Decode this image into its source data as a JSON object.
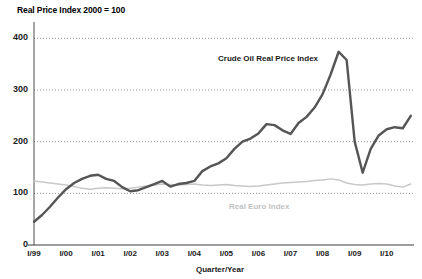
{
  "chart_data": {
    "type": "line",
    "title": "Real Price Index 2000 = 100",
    "xlabel": "Quarter/Year",
    "ylabel": "",
    "ylim": [
      0,
      420
    ],
    "yticks": [
      0,
      100,
      200,
      300,
      400
    ],
    "grid": true,
    "legend_position": "inline-annotation",
    "x_categories": [
      "I/99",
      "I/00",
      "I/01",
      "I/02",
      "I/03",
      "I/04",
      "I/05",
      "I/06",
      "I/07",
      "I/08",
      "I/09",
      "I/10"
    ],
    "series": [
      {
        "name": "Crude Oil Real Price Index",
        "color": "#555555",
        "x": [
          1999.0,
          1999.25,
          1999.5,
          1999.75,
          2000.0,
          2000.25,
          2000.5,
          2000.75,
          2001.0,
          2001.25,
          2001.5,
          2001.75,
          2002.0,
          2002.25,
          2002.5,
          2002.75,
          2003.0,
          2003.25,
          2003.5,
          2003.75,
          2004.0,
          2004.25,
          2004.5,
          2004.75,
          2005.0,
          2005.25,
          2005.5,
          2005.75,
          2006.0,
          2006.25,
          2006.5,
          2006.75,
          2007.0,
          2007.25,
          2007.5,
          2007.75,
          2008.0,
          2008.25,
          2008.5,
          2008.75,
          2009.0,
          2009.25,
          2009.5,
          2009.75,
          2010.0,
          2010.25,
          2010.5,
          2010.75
        ],
        "values": [
          45,
          58,
          74,
          92,
          108,
          120,
          128,
          134,
          136,
          128,
          124,
          112,
          104,
          106,
          112,
          118,
          124,
          113,
          118,
          120,
          124,
          143,
          152,
          158,
          168,
          186,
          200,
          206,
          216,
          234,
          232,
          222,
          215,
          236,
          248,
          266,
          292,
          330,
          374,
          358,
          200,
          140,
          186,
          212,
          224,
          228,
          226,
          250
        ]
      },
      {
        "name": "Real Euro Index",
        "color": "#c8c8c8",
        "x": [
          1999.0,
          1999.25,
          1999.5,
          1999.75,
          2000.0,
          2000.25,
          2000.5,
          2000.75,
          2001.0,
          2001.25,
          2001.5,
          2001.75,
          2002.0,
          2002.25,
          2002.5,
          2002.75,
          2003.0,
          2003.25,
          2003.5,
          2003.75,
          2004.0,
          2004.25,
          2004.5,
          2004.75,
          2005.0,
          2005.25,
          2005.5,
          2005.75,
          2006.0,
          2006.25,
          2006.5,
          2006.75,
          2007.0,
          2007.25,
          2007.5,
          2007.75,
          2008.0,
          2008.25,
          2008.5,
          2008.75,
          2009.0,
          2009.25,
          2009.5,
          2009.75,
          2010.0,
          2010.25,
          2010.5,
          2010.75
        ],
        "values": [
          124,
          122,
          120,
          118,
          116,
          113,
          110,
          108,
          110,
          111,
          110,
          109,
          110,
          112,
          114,
          116,
          118,
          117,
          116,
          117,
          118,
          116,
          115,
          116,
          117,
          115,
          114,
          113,
          114,
          116,
          118,
          120,
          121,
          122,
          123,
          125,
          126,
          128,
          126,
          120,
          117,
          116,
          118,
          119,
          118,
          114,
          112,
          118
        ]
      }
    ],
    "annotations": [
      {
        "text": "Crude Oil Real Price Index",
        "color": "#1a1a1a"
      },
      {
        "text": "Real Euro Index",
        "color": "#c2c2c2"
      }
    ]
  },
  "axis": {
    "y_tick_labels": [
      "400",
      "300",
      "200",
      "100",
      "0"
    ],
    "x_tick_labels": [
      "I/99",
      "I/00",
      "I/01",
      "I/02",
      "I/03",
      "I/04",
      "I/05",
      "I/06",
      "I/07",
      "I/08",
      "I/09",
      "I/10"
    ],
    "x_title": "Quarter/Year"
  },
  "title": "Real Price Index 2000 = 100"
}
